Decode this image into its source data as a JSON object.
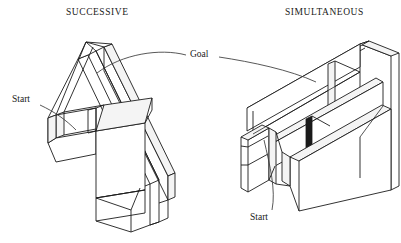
{
  "figure": {
    "type": "line-diagram",
    "background_color": "#ffffff",
    "ink_color": "#1c1c1c",
    "width": 401,
    "height": 243
  },
  "panels": [
    {
      "id": "successive",
      "caption": "SUCCESSIVE",
      "caption_position": {
        "x": 66,
        "y": 8
      },
      "description": "T-shaped / L-shaped open-top maze drawn in oblique isometric projection with double-thickness walls",
      "labels": [
        {
          "name": "start",
          "text": "Start",
          "x": 12,
          "y": 95
        }
      ]
    },
    {
      "id": "simultaneous",
      "caption": "SIMULTANEOUS",
      "caption_position": {
        "x": 285,
        "y": 8
      },
      "description": "Rectangular open-top maze with a central divider forming two parallel alleys, drawn in oblique isometric projection",
      "labels": [
        {
          "name": "start",
          "text": "Start",
          "x": 250,
          "y": 213
        }
      ]
    }
  ],
  "shared_labels": [
    {
      "name": "goal",
      "text": "Goal",
      "x": 190,
      "y": 50,
      "leader_lines": 2,
      "note": "single centered label with curved leader lines pointing to both mazes"
    }
  ],
  "colors": {
    "ink": "#1c1c1c",
    "leader": "#3a3a3a",
    "face_light": "#ffffff",
    "face_shade": "#f4f4f4",
    "background": "#ffffff"
  }
}
